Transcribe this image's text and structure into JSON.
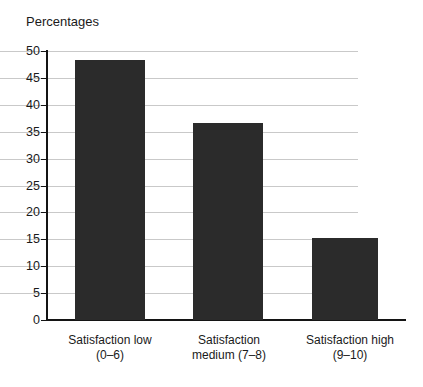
{
  "chart_data": {
    "type": "bar",
    "title": "Percentages",
    "xlabel": "",
    "ylabel": "",
    "categories": [
      "Satisfaction low (0–6)",
      "Satisfaction medium (7–8)",
      "Satisfaction high (9–10)"
    ],
    "category_lines": [
      [
        "Satisfaction low",
        "(0–6)"
      ],
      [
        "Satisfaction",
        "medium (7–8)"
      ],
      [
        "Satisfaction high",
        "(9–10)"
      ]
    ],
    "values": [
      48.4,
      36.6,
      15.2
    ],
    "ylim": [
      0,
      50
    ],
    "yticks": [
      0,
      5,
      10,
      15,
      20,
      25,
      30,
      35,
      40,
      45,
      50
    ],
    "ytick_labels": [
      "0",
      "5",
      "10",
      "15",
      "20",
      "25",
      "30",
      "35",
      "40",
      "45",
      "50"
    ],
    "grid": true,
    "legend": false,
    "colors": {
      "bar": "#2b2b2b",
      "gridline": "#c9c9c9",
      "axis": "#141414",
      "background": "#ffffff",
      "text": "#1a1a1a"
    }
  }
}
